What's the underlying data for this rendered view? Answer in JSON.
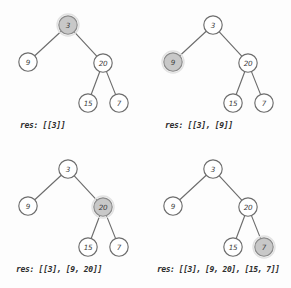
{
  "diagram": {
    "tree": {
      "nodes": [
        {
          "id": "n3",
          "value": "3",
          "cx": 68,
          "cy": 25,
          "r": 9.2
        },
        {
          "id": "n9",
          "value": "9",
          "cx": 28,
          "cy": 62,
          "r": 9.2
        },
        {
          "id": "n20",
          "value": "20",
          "cx": 103,
          "cy": 63,
          "r": 9.2
        },
        {
          "id": "n15",
          "value": "15",
          "cx": 88,
          "cy": 103,
          "r": 9.2
        },
        {
          "id": "n7",
          "value": "7",
          "cx": 119,
          "cy": 103,
          "r": 9.2
        }
      ],
      "edges": [
        {
          "from": "n3",
          "to": "n9"
        },
        {
          "from": "n3",
          "to": "n20"
        },
        {
          "from": "n20",
          "to": "n15"
        },
        {
          "from": "n20",
          "to": "n7"
        }
      ]
    },
    "colors": {
      "background": "#fdfdfd",
      "node_fill": "#ffffff",
      "node_stroke": "#6d6d6d",
      "highlight_fill": "#c8c8c8",
      "highlight_stroke": "#8a8a8a",
      "edge": "#6d6d6d",
      "text": "#2e2e2e"
    },
    "panels": [
      {
        "id": "panel-1",
        "position": "top-left",
        "highlighted_node": "n3",
        "caption": "res: [[3]]"
      },
      {
        "id": "panel-2",
        "position": "top-right",
        "highlighted_node": "n9",
        "caption": "res: [[3], [9]]"
      },
      {
        "id": "panel-3",
        "position": "bottom-left",
        "highlighted_node": "n20",
        "caption": "res: [[3], [9, 20]]"
      },
      {
        "id": "panel-4",
        "position": "bottom-right",
        "highlighted_node": "n7",
        "caption": "res: [[3], [9, 20], [15, 7]]"
      }
    ]
  }
}
